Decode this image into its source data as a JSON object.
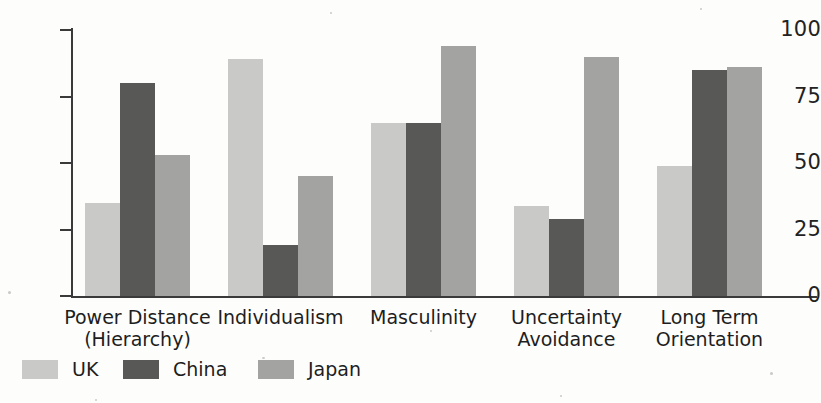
{
  "chart_data": {
    "type": "bar",
    "title": "",
    "xlabel": "",
    "ylabel": "",
    "ylim": [
      0,
      100
    ],
    "yticks": [
      0,
      25,
      50,
      75,
      100
    ],
    "ytick_labels": [
      "0",
      "25",
      "50",
      "75",
      "100"
    ],
    "grid": false,
    "legend_position": "bottom-left",
    "categories": [
      "Power Distance\n(Hierarchy)",
      "Individualism",
      "Masculinity",
      "Uncertainty\nAvoidance",
      "Long Term\nOrientation"
    ],
    "series": [
      {
        "name": "UK",
        "color": "#c9c9c7",
        "values": [
          35,
          89,
          65,
          34,
          49
        ]
      },
      {
        "name": "China",
        "color": "#585857",
        "values": [
          80,
          19,
          65,
          29,
          85
        ]
      },
      {
        "name": "Japan",
        "color": "#a3a3a1",
        "values": [
          53,
          45,
          94,
          90,
          86
        ]
      }
    ]
  },
  "legend": {
    "items": [
      {
        "label": "UK",
        "color": "#c9c9c7"
      },
      {
        "label": "China",
        "color": "#585857"
      },
      {
        "label": "Japan",
        "color": "#a3a3a1"
      }
    ]
  }
}
